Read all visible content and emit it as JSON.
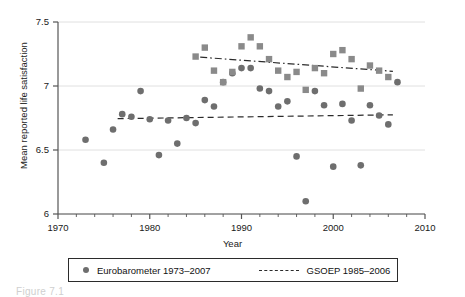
{
  "chart_data": {
    "type": "scatter",
    "title": "",
    "xlabel": "Year",
    "ylabel": "Mean reported life satisfaction",
    "xlim": [
      1970,
      2010
    ],
    "ylim": [
      6,
      7.5
    ],
    "xticks": [
      1970,
      1980,
      1990,
      2000,
      2010
    ],
    "xtick_labels": [
      "1970",
      "1980",
      "1990",
      "2000",
      "2010"
    ],
    "yticks": [
      6,
      6.5,
      7,
      7.5
    ],
    "ytick_labels": [
      "6",
      "6.5",
      "7",
      "7.5"
    ],
    "grid": "horizontal",
    "legend_position": "below",
    "marker_color": "#6e6e6e",
    "line_color": "#2b2b2b",
    "series": [
      {
        "name": "Eurobarometer 1973–2007",
        "marker": "circle",
        "color": "#6e6e6e",
        "x": [
          1973,
          1975,
          1976,
          1977,
          1978,
          1979,
          1980,
          1981,
          1982,
          1983,
          1984,
          1985,
          1986,
          1987,
          1988,
          1989,
          1990,
          1991,
          1992,
          1993,
          1994,
          1995,
          1996,
          1997,
          1998,
          1999,
          2000,
          2001,
          2002,
          2003,
          2004,
          2005,
          2006,
          2007
        ],
        "values": [
          6.58,
          6.4,
          6.66,
          6.78,
          6.76,
          6.96,
          6.74,
          6.46,
          6.73,
          6.55,
          6.75,
          6.71,
          6.89,
          6.84,
          7.03,
          7.1,
          7.14,
          7.14,
          6.98,
          6.96,
          6.84,
          6.88,
          6.45,
          6.1,
          6.96,
          6.85,
          6.37,
          6.86,
          6.73,
          6.38,
          6.85,
          6.77,
          6.7,
          7.03
        ],
        "trend": {
          "name": "Eurobarometer trend",
          "style": "dashed",
          "x": [
            1976.5,
            2006.5
          ],
          "y": [
            6.745,
            6.775
          ]
        }
      },
      {
        "name": "GSOEP 1985–2006",
        "marker": "square",
        "color": "#8a8a8a",
        "x": [
          1985,
          1986,
          1987,
          1988,
          1989,
          1990,
          1991,
          1992,
          1993,
          1994,
          1995,
          1996,
          1997,
          1998,
          1999,
          2000,
          2001,
          2002,
          2003,
          2004,
          2005,
          2006
        ],
        "values": [
          7.23,
          7.3,
          7.12,
          7.03,
          7.11,
          7.31,
          7.38,
          7.31,
          7.21,
          7.12,
          7.07,
          7.11,
          6.97,
          7.14,
          7.1,
          7.25,
          7.28,
          7.21,
          6.98,
          7.16,
          7.12,
          7.07
        ],
        "trend": {
          "name": "GSOEP trend",
          "style": "dash-dot",
          "x": [
            1985.5,
            2006.5
          ],
          "y": [
            7.225,
            7.115
          ]
        }
      }
    ]
  },
  "legend": {
    "eurobarometer_label": "Eurobarometer 1973–2007",
    "gsoep_label": "GSOEP 1985–2006"
  },
  "caption": {
    "text": "Figure 7.1"
  }
}
